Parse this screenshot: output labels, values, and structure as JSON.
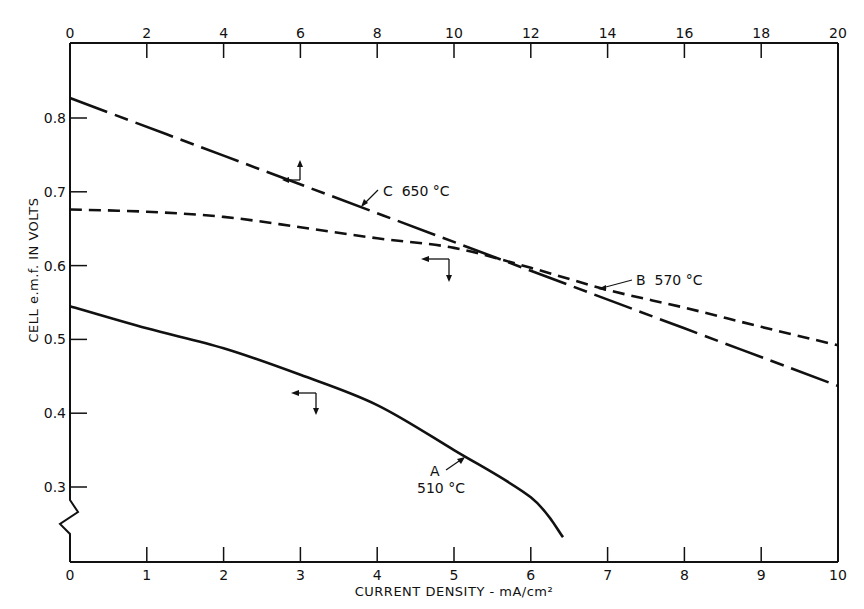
{
  "chart_data": {
    "type": "line",
    "title": "",
    "xlabel": "CURRENT DENSITY - mA/cm²",
    "ylabel": "CELL e.m.f. IN VOLTS",
    "xlim": [
      0,
      10
    ],
    "xlim_top": [
      0,
      20
    ],
    "ylim": [
      0.23,
      0.87
    ],
    "y_axis_break": true,
    "grid": false,
    "legend": "none (curves labelled inline)",
    "x_ticks_bottom": [
      "0",
      "1",
      "2",
      "3",
      "4",
      "5",
      "6",
      "7",
      "8",
      "9",
      "10"
    ],
    "x_ticks_top": [
      "0",
      "2",
      "4",
      "6",
      "8",
      "10",
      "12",
      "14",
      "16",
      "18",
      "20"
    ],
    "y_ticks": [
      "0.3",
      "0.4",
      "0.5",
      "0.6",
      "0.7",
      "0.8"
    ],
    "series": [
      {
        "name": "A 510 °C",
        "label_line1": "A",
        "label_line2": "510 °C",
        "axis": "bottom x (0–10)",
        "style": "solid",
        "x": [
          0,
          1,
          2,
          3,
          4,
          5,
          6,
          6.42
        ],
        "values": [
          0.545,
          0.515,
          0.488,
          0.452,
          0.411,
          0.35,
          0.286,
          0.232
        ]
      },
      {
        "name": "B 570 °C",
        "label": "B  570 °C",
        "axis": "bottom x (0–10)",
        "style": "dashed",
        "x": [
          0,
          1,
          2,
          3,
          4,
          5,
          6,
          7,
          8,
          9,
          10
        ],
        "values": [
          0.676,
          0.673,
          0.666,
          0.652,
          0.637,
          0.624,
          0.597,
          0.567,
          0.543,
          0.517,
          0.492
        ]
      },
      {
        "name": "C 650 °C",
        "label": "C  650 °C",
        "axis": "top x (0–20)",
        "style": "dash-dot",
        "x": [
          0,
          4,
          8,
          12,
          16,
          20
        ],
        "values": [
          0.827,
          0.749,
          0.671,
          0.593,
          0.515,
          0.437
        ]
      }
    ],
    "annotations": [
      "Arrow marker on curve C points up/right → read against top axis",
      "Arrow markers on curves A and B point left/down → read against bottom axis"
    ]
  }
}
